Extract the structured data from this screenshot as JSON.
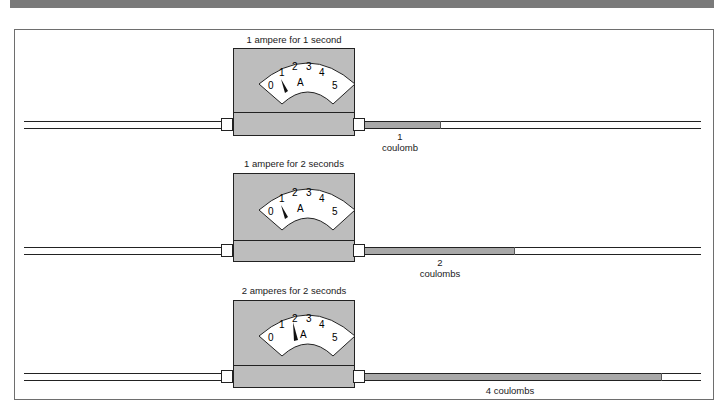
{
  "title_bar_color": "#7a7a7a",
  "meter": {
    "unit": "A",
    "scale": [
      "0",
      "1",
      "2",
      "3",
      "4",
      "5"
    ],
    "housing_color": "#bdbdbd",
    "charge_color": "#a8a8a8"
  },
  "panels": [
    {
      "caption": "1 ampere for 1 second",
      "current_amperes": 1,
      "time_seconds": 1,
      "charge_number": "1",
      "charge_unit": "coulomb",
      "charge_label": ""
    },
    {
      "caption": "1 ampere for 2 seconds",
      "current_amperes": 1,
      "time_seconds": 2,
      "charge_number": "2",
      "charge_unit": "coulombs",
      "charge_label": ""
    },
    {
      "caption": "2 amperes for 2 seconds",
      "current_amperes": 2,
      "time_seconds": 2,
      "charge_number": "",
      "charge_unit": "",
      "charge_label": "4 coulombs"
    }
  ]
}
